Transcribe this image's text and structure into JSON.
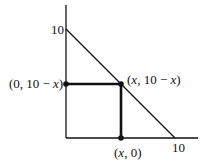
{
  "diagram": {
    "type": "coordinate-geometry",
    "y_axis_tick_label": "10",
    "x_axis_tick_label": "10",
    "line": {
      "from": [
        0,
        10
      ],
      "to": [
        10,
        0
      ],
      "equation": "y = 10 - x"
    },
    "points": [
      {
        "id": "left",
        "label_prefix": "(0, 10 ",
        "label_minus": "−",
        "label_var": "x",
        "label_suffix": ")"
      },
      {
        "id": "corner",
        "label_prefix": "(",
        "label_var": "x",
        "label_mid": ", 10 − ",
        "label_var2": "x",
        "label_suffix": ")"
      },
      {
        "id": "bottom",
        "label_prefix": "(",
        "label_var": "x",
        "label_suffix": ", 0)"
      }
    ],
    "rectangle": {
      "vertices": [
        "(0, 0)",
        "(x, 0)",
        "(x, 10 - x)",
        "(0, 10 - x)"
      ]
    },
    "colors": {
      "stroke": "#111111",
      "background": "#ffffff"
    }
  }
}
